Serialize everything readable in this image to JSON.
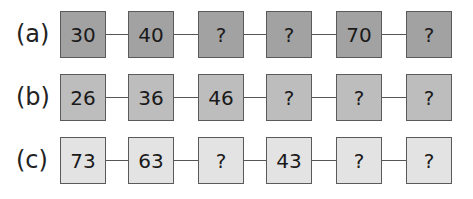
{
  "sequences": [
    {
      "label": "(a)",
      "fill": "#a2a2a2",
      "values": [
        "30",
        "40",
        "?",
        "?",
        "70",
        "?"
      ]
    },
    {
      "label": "(b)",
      "fill": "#bdbdbd",
      "values": [
        "26",
        "36",
        "46",
        "?",
        "?",
        "?"
      ]
    },
    {
      "label": "(c)",
      "fill": "#e3e3e3",
      "values": [
        "73",
        "63",
        "?",
        "43",
        "?",
        "?"
      ]
    }
  ]
}
